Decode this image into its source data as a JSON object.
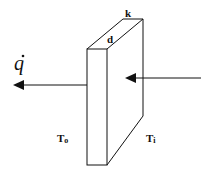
{
  "diagram": {
    "type": "heat conduction through a slab",
    "labels": {
      "heat_flux": "q",
      "conductivity": "k",
      "thickness": "d",
      "outer_temperature": "T",
      "outer_temperature_sub": "o",
      "inner_temperature": "T",
      "inner_temperature_sub": "i"
    },
    "colors": {
      "stroke": "#111111",
      "background": "#ffffff"
    }
  }
}
